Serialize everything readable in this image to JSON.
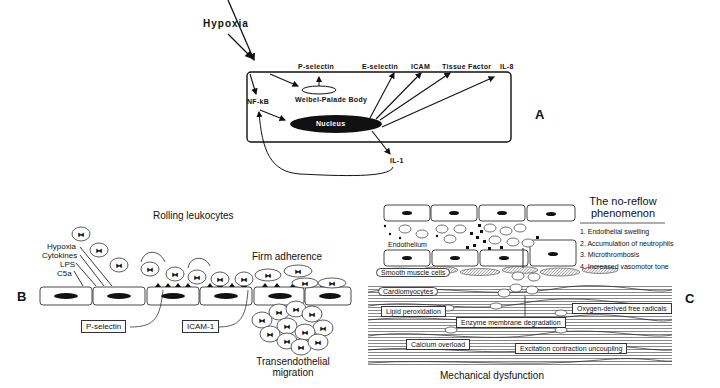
{
  "panelA": {
    "letter": "A",
    "stimulus": "Hypoxia",
    "labels": {
      "p_selectin": "P-selectin",
      "e_selectin": "E-selectin",
      "icam": "ICAM",
      "tissue_factor": "Tissue  Factor",
      "il8": "IL-8",
      "nfkb": "NF-kB",
      "weibel_palade": "Weibel-Palade   Body",
      "nucleus": "Nucleus",
      "il1": "IL-1"
    }
  },
  "panelB": {
    "letter": "B",
    "rolling": "Rolling leukocytes",
    "firm": "Firm adherence",
    "transmigration_line1": "Transendothelial",
    "transmigration_line2": "migration",
    "stimuli": [
      "Hypoxia",
      "Cytokines",
      "LPS",
      "C5a"
    ],
    "p_selectin_box": "P-selectin",
    "icam1_box": "ICAM-1"
  },
  "panelC": {
    "letter": "C",
    "title_line1": "The no-reflow",
    "title_line2": "phenomenon",
    "list": [
      "1. Endothelial swelling",
      "2. Accumulation of neutrophils",
      "3. Microthrombosis",
      "4. Increased vasomotor tone"
    ],
    "endothelium": "Endothelium",
    "smooth_muscle": "Smooth muscle cells",
    "cardiomyocytes": "Cardiomyocytes",
    "boxes": {
      "lipid": "Lipid peroxidation",
      "enzyme": "Enzyme membrane degradation",
      "oxygen": "Oxygen-derived free radicals",
      "calcium": "Calcium overload",
      "excitation": "Excitation contraction uncoupling"
    },
    "footer": "Mechanical dysfunction"
  }
}
